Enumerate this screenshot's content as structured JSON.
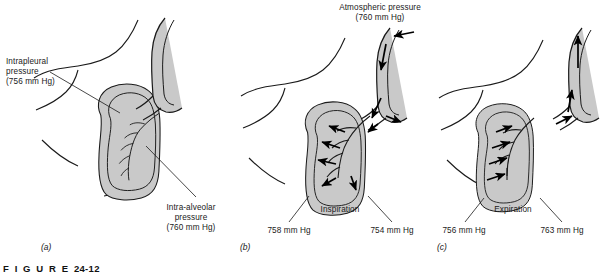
{
  "figure": {
    "caption_word": "F I G U R E",
    "caption_number": "24-12",
    "colors": {
      "lung_fill": "#c9c9c9",
      "outline": "#1a1a1a",
      "arrow": "#000000",
      "page_background": "#ffffff"
    }
  },
  "panels": [
    {
      "id": "a",
      "letter": "(a)",
      "labels": [
        {
          "name": "intrapleural-pressure-label",
          "line1": "Intrapleural",
          "line2": "pressure",
          "line3": "(756 mm Hg)"
        },
        {
          "name": "intra-alveolar-pressure-label",
          "line1": "Intra-alveolar",
          "line2": "pressure",
          "line3": "(760 mm Hg)"
        }
      ]
    },
    {
      "id": "b",
      "letter": "(b)",
      "top_label": {
        "line1": "Atmospheric pressure",
        "line2": "(760 mm Hg)"
      },
      "phase": "Inspiration",
      "pressure_left": "758 mm Hg",
      "pressure_right": "754 mm Hg"
    },
    {
      "id": "c",
      "letter": "(c)",
      "phase": "Expiration",
      "pressure_left": "756 mm Hg",
      "pressure_right": "763 mm Hg"
    }
  ]
}
